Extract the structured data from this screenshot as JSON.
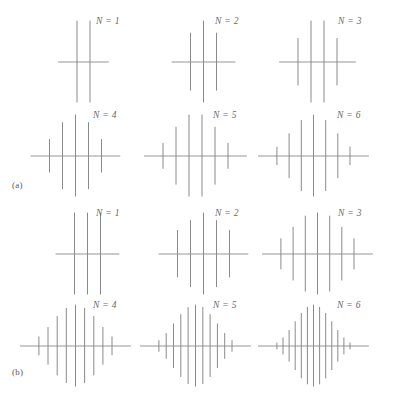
{
  "figure": {
    "panels": [
      {
        "id": "a",
        "label": "(a)",
        "nucleus_spin": "1/2",
        "spectra": [
          {
            "n_label": "N = 1",
            "n": 1,
            "num_lines": 2,
            "intensities": [
              1,
              1
            ]
          },
          {
            "n_label": "N = 2",
            "n": 2,
            "num_lines": 3,
            "intensities": [
              1,
              2,
              1
            ]
          },
          {
            "n_label": "N = 3",
            "n": 3,
            "num_lines": 4,
            "intensities": [
              1,
              3,
              3,
              1
            ]
          },
          {
            "n_label": "N = 4",
            "n": 4,
            "num_lines": 5,
            "intensities": [
              1,
              4,
              6,
              4,
              1
            ]
          },
          {
            "n_label": "N = 5",
            "n": 5,
            "num_lines": 6,
            "intensities": [
              1,
              5,
              10,
              10,
              5,
              1
            ]
          },
          {
            "n_label": "N = 6",
            "n": 6,
            "num_lines": 7,
            "intensities": [
              1,
              6,
              15,
              20,
              15,
              6,
              1
            ]
          }
        ]
      },
      {
        "id": "b",
        "label": "(b)",
        "nucleus_spin": "1",
        "spectra": [
          {
            "n_label": "N = 1",
            "n": 1,
            "num_lines": 3,
            "intensities": [
              1,
              1,
              1
            ]
          },
          {
            "n_label": "N = 2",
            "n": 2,
            "num_lines": 5,
            "intensities": [
              1,
              2,
              3,
              2,
              1
            ]
          },
          {
            "n_label": "N = 3",
            "n": 3,
            "num_lines": 7,
            "intensities": [
              1,
              3,
              6,
              7,
              6,
              3,
              1
            ]
          },
          {
            "n_label": "N = 4",
            "n": 4,
            "num_lines": 9,
            "intensities": [
              1,
              4,
              10,
              16,
              19,
              16,
              10,
              4,
              1
            ]
          },
          {
            "n_label": "N = 5",
            "n": 5,
            "num_lines": 11,
            "intensities": [
              1,
              5,
              15,
              30,
              45,
              51,
              45,
              30,
              15,
              5,
              1
            ]
          },
          {
            "n_label": "N = 6",
            "n": 6,
            "num_lines": 13,
            "intensities": [
              1,
              6,
              21,
              50,
              90,
              126,
              141,
              126,
              90,
              50,
              21,
              6,
              1
            ]
          }
        ]
      }
    ]
  },
  "chart_data": {
    "type": "line",
    "title": "",
    "xlabel": "",
    "ylabel": "",
    "grid": false,
    "legend": "none",
    "series": [
      {
        "name": "(a) N = 1",
        "x": [
          -0.5,
          0.5
        ],
        "values": [
          1,
          1
        ]
      },
      {
        "name": "(a) N = 2",
        "x": [
          -1,
          0,
          1
        ],
        "values": [
          1,
          2,
          1
        ]
      },
      {
        "name": "(a) N = 3",
        "x": [
          -1.5,
          -0.5,
          0.5,
          1.5
        ],
        "values": [
          1,
          3,
          3,
          1
        ]
      },
      {
        "name": "(a) N = 4",
        "x": [
          -2,
          -1,
          0,
          1,
          2
        ],
        "values": [
          1,
          4,
          6,
          4,
          1
        ]
      },
      {
        "name": "(a) N = 5",
        "x": [
          -2.5,
          -1.5,
          -0.5,
          0.5,
          1.5,
          2.5
        ],
        "values": [
          1,
          5,
          10,
          10,
          5,
          1
        ]
      },
      {
        "name": "(a) N = 6",
        "x": [
          -3,
          -2,
          -1,
          0,
          1,
          2,
          3
        ],
        "values": [
          1,
          6,
          15,
          20,
          15,
          6,
          1
        ]
      },
      {
        "name": "(b) N = 1",
        "x": [
          -1,
          0,
          1
        ],
        "values": [
          1,
          1,
          1
        ]
      },
      {
        "name": "(b) N = 2",
        "x": [
          -2,
          -1,
          0,
          1,
          2
        ],
        "values": [
          1,
          2,
          3,
          2,
          1
        ]
      },
      {
        "name": "(b) N = 3",
        "x": [
          -3,
          -2,
          -1,
          0,
          1,
          2,
          3
        ],
        "values": [
          1,
          3,
          6,
          7,
          6,
          3,
          1
        ]
      },
      {
        "name": "(b) N = 4",
        "x": [
          -4,
          -3,
          -2,
          -1,
          0,
          1,
          2,
          3,
          4
        ],
        "values": [
          1,
          4,
          10,
          16,
          19,
          16,
          10,
          4,
          1
        ]
      },
      {
        "name": "(b) N = 5",
        "x": [
          -5,
          -4,
          -3,
          -2,
          -1,
          0,
          1,
          2,
          3,
          4,
          5
        ],
        "values": [
          1,
          5,
          15,
          30,
          45,
          51,
          45,
          30,
          15,
          5,
          1
        ]
      },
      {
        "name": "(b) N = 6",
        "x": [
          -6,
          -5,
          -4,
          -3,
          -2,
          -1,
          0,
          1,
          2,
          3,
          4,
          5,
          6
        ],
        "values": [
          1,
          6,
          21,
          50,
          90,
          126,
          141,
          126,
          90,
          50,
          21,
          6,
          1
        ]
      }
    ]
  },
  "style": {
    "line_color": "#8a8a8a",
    "baseline_color": "#8a8a8a",
    "text_color": "#6a6a6a",
    "background": "#ffffff"
  },
  "layout": {
    "cell_width": 118,
    "cell_height": 92,
    "columns": 3,
    "panel_a_positions": [
      {
        "left": 28,
        "top": 16
      },
      {
        "left": 148,
        "top": 16
      },
      {
        "left": 262,
        "top": 16
      },
      {
        "left": 20,
        "top": 110
      },
      {
        "left": 140,
        "top": 110
      },
      {
        "left": 258,
        "top": 110
      }
    ],
    "panel_b_positions": [
      {
        "left": 32,
        "top": 8
      },
      {
        "left": 148,
        "top": 8
      },
      {
        "left": 262,
        "top": 8
      },
      {
        "left": 20,
        "top": 100
      },
      {
        "left": 140,
        "top": 100
      },
      {
        "left": 258,
        "top": 100
      }
    ],
    "label_offsets_a": [
      {
        "left": 96,
        "top": 16
      },
      {
        "left": 215,
        "top": 16
      },
      {
        "left": 338,
        "top": 16
      },
      {
        "left": 93,
        "top": 110
      },
      {
        "left": 213,
        "top": 110
      },
      {
        "left": 337,
        "top": 110
      }
    ],
    "label_offsets_b": [
      {
        "left": 96,
        "top": 8
      },
      {
        "left": 215,
        "top": 8
      },
      {
        "left": 338,
        "top": 8
      },
      {
        "left": 93,
        "top": 100
      },
      {
        "left": 213,
        "top": 100
      },
      {
        "left": 337,
        "top": 100
      }
    ]
  }
}
